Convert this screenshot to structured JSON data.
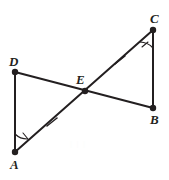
{
  "diagram": {
    "background_color": "#ffffff",
    "stroke_color": "#231f20",
    "mark_color": "#231f20",
    "width": 169,
    "height": 180,
    "points": [
      {
        "id": "A",
        "label": "A",
        "x": 15,
        "y": 152,
        "label_x": 10,
        "label_y": 158
      },
      {
        "id": "B",
        "label": "B",
        "x": 153,
        "y": 108,
        "label_x": 150,
        "label_y": 113
      },
      {
        "id": "C",
        "label": "C",
        "x": 153,
        "y": 30,
        "label_x": 150,
        "label_y": 12
      },
      {
        "id": "D",
        "label": "D",
        "x": 15,
        "y": 72,
        "label_x": 9,
        "label_y": 55
      },
      {
        "id": "E",
        "label": "E",
        "x": 85,
        "y": 91,
        "label_x": 76,
        "label_y": 73
      }
    ],
    "segments": [
      {
        "id": "DA",
        "from": "D",
        "to": "A",
        "ticks": 0
      },
      {
        "id": "CB",
        "from": "C",
        "to": "B",
        "ticks": 0
      },
      {
        "id": "AC",
        "from": "A",
        "to": "C",
        "ticks": 0
      },
      {
        "id": "DB",
        "from": "D",
        "to": "B",
        "ticks": 0
      }
    ],
    "congruent_side_marks": [
      {
        "id": "tick-AE",
        "on_segment": "AE",
        "x": 52,
        "y": 122,
        "count": 1
      },
      {
        "id": "tick-EC",
        "on_segment": "EC",
        "x": 120,
        "y": 60,
        "count": 1
      }
    ],
    "angle_marks": [
      {
        "id": "angle-A",
        "at_vertex": "A",
        "count": 1
      },
      {
        "id": "angle-C",
        "at_vertex": "C",
        "count": 1
      }
    ],
    "watermark_text": "l l l"
  }
}
